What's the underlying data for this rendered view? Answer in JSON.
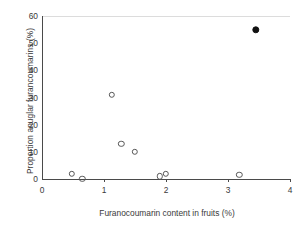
{
  "chart_data": {
    "type": "scatter",
    "title": "",
    "xlabel": "Furanocoumarin content in fruits (%)",
    "ylabel": "Proportion anuglar furancoumarins (%)",
    "xlim": [
      0,
      4
    ],
    "ylim": [
      0,
      60
    ],
    "xticks": [
      "0",
      "1",
      "2",
      "3",
      "4"
    ],
    "xtick_values": [
      0,
      1,
      2,
      3,
      4
    ],
    "yticks": [
      "0",
      "10",
      "20",
      "30",
      "40",
      "50",
      "60"
    ],
    "ytick_values": [
      0,
      10,
      20,
      30,
      40,
      50,
      60
    ],
    "grid": false,
    "legend": "none",
    "series": [
      {
        "name": "open-circle-points",
        "marker": "open-circle",
        "color": "#585858",
        "points": [
          {
            "x": 0.48,
            "y": 2.0
          },
          {
            "x": 0.65,
            "y": 0.0
          },
          {
            "x": 1.13,
            "y": 31.0
          },
          {
            "x": 1.28,
            "y": 13.0
          },
          {
            "x": 1.5,
            "y": 10.0
          },
          {
            "x": 1.9,
            "y": 1.0
          },
          {
            "x": 2.0,
            "y": 2.0
          },
          {
            "x": 3.18,
            "y": 1.5
          }
        ]
      },
      {
        "name": "filled-circle-point",
        "marker": "filled-circle",
        "color": "#111111",
        "points": [
          {
            "x": 3.45,
            "y": 55.0
          }
        ]
      }
    ]
  }
}
